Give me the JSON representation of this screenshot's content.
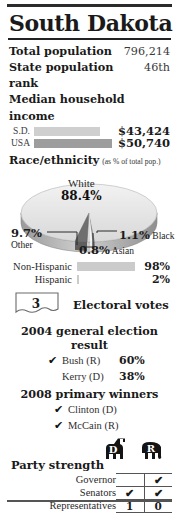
{
  "title": "South Dakota",
  "stats": [
    {
      "label": "Total population",
      "value": "796,214"
    },
    {
      "label": "State population rank",
      "value": "46th"
    }
  ],
  "income": {
    "heading": "Median household income",
    "rows": [
      {
        "label": "S.D.",
        "value": "$43,424",
        "bar_pct": 85,
        "color": "#cfcfcf"
      },
      {
        "label": "USA",
        "value": "$50,740",
        "bar_pct": 100,
        "color": "#9d9d9d"
      }
    ]
  },
  "race": {
    "heading": "Race/ethnicity",
    "note": "(as % of total pop.)",
    "slices": [
      {
        "name": "White",
        "value": "88.4%"
      },
      {
        "name": "Other",
        "value": "9.7%"
      },
      {
        "name": "Black",
        "value": "1.1%"
      },
      {
        "name": "Asian",
        "value": "0.8%"
      }
    ]
  },
  "hispanic": {
    "rows": [
      {
        "label": "Non-Hispanic",
        "value": "98%",
        "bar_pct": 100,
        "color": "#cbcbcb"
      },
      {
        "label": "Hispanic",
        "value": "2%",
        "bar_pct": 2,
        "color": "#cbcbcb"
      }
    ]
  },
  "electoral": {
    "votes": "3",
    "label": "Electoral votes"
  },
  "general_election": {
    "heading": "2004 general election result",
    "rows": [
      {
        "check": "✔",
        "name": "Bush (R)",
        "pct": "60%"
      },
      {
        "check": "",
        "name": "Kerry (D)",
        "pct": "38%"
      }
    ]
  },
  "primary": {
    "heading": "2008 primary winners",
    "rows": [
      {
        "check": "✔",
        "name": "Clinton (D)"
      },
      {
        "check": "✔",
        "name": "McCain (R)"
      }
    ]
  },
  "party_strength": {
    "title": "Party strength",
    "columns": [
      "D",
      "R"
    ],
    "rows": [
      {
        "label": "Governor",
        "d": "",
        "r": "✔"
      },
      {
        "label": "Senators",
        "d": "✔",
        "r": "✔"
      },
      {
        "label": "Representatives",
        "d": "1",
        "r": "0"
      }
    ]
  },
  "colors": {
    "ink": "#1a1a1a",
    "rule": "#2b2b2b",
    "bar_light": "#cfcfcf",
    "bar_dark": "#9d9d9d",
    "pie_top": "#e6e6e6",
    "pie_other": "#6f6f6f"
  }
}
